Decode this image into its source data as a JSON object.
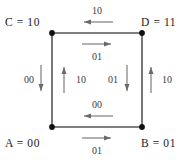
{
  "diagram": {
    "type": "state-transition-square",
    "vertices": [
      {
        "id": "C",
        "label": "C = 10",
        "position": "top-left",
        "x": 52,
        "y": 33
      },
      {
        "id": "D",
        "label": "D = 11",
        "position": "top-right",
        "x": 142,
        "y": 33
      },
      {
        "id": "A",
        "label": "A = 00",
        "position": "bottom-left",
        "x": 52,
        "y": 127
      },
      {
        "id": "B",
        "label": "B = 01",
        "position": "bottom-right",
        "x": 142,
        "y": 127
      }
    ],
    "edges": [
      {
        "name": "top-outer",
        "label": "10",
        "direction": "left",
        "side": "outside"
      },
      {
        "name": "top-inner",
        "label": "01",
        "direction": "right",
        "side": "inside"
      },
      {
        "name": "bottom-inner",
        "label": "00",
        "direction": "left",
        "side": "inside"
      },
      {
        "name": "bottom-outer",
        "label": "01",
        "direction": "right",
        "side": "outside"
      },
      {
        "name": "left-outer",
        "label": "00",
        "direction": "down",
        "side": "outside"
      },
      {
        "name": "left-inner",
        "label": "10",
        "direction": "up",
        "side": "inside"
      },
      {
        "name": "right-inner",
        "label": "01",
        "direction": "down",
        "side": "inside"
      },
      {
        "name": "right-outer",
        "label": "10",
        "direction": "up",
        "side": "outside"
      }
    ],
    "colors": {
      "edge": "#555555",
      "vertex": "#111111",
      "arrow": "#6a6a6a",
      "text": "#1a1a1a",
      "arrow_text": "#3a3a3a",
      "background": "#ffffff"
    }
  }
}
